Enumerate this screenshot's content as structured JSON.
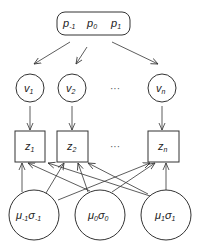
{
  "diagram": {
    "top_node": {
      "labels": [
        "p",
        "p",
        "p"
      ],
      "subs": [
        "-1",
        "0",
        "1"
      ]
    },
    "v_nodes": [
      {
        "base": "v",
        "sub": "1"
      },
      {
        "base": "v",
        "sub": "2"
      },
      {
        "base": "v",
        "sub": "n"
      }
    ],
    "z_nodes": [
      {
        "base": "z",
        "sub": "1"
      },
      {
        "base": "z",
        "sub": "2"
      },
      {
        "base": "z",
        "sub": "n"
      }
    ],
    "bottom_nodes": [
      {
        "mu": "μ",
        "mu_sub": "-1",
        "sigma": "σ",
        "sigma_sub": "-1"
      },
      {
        "mu": "μ",
        "mu_sub": "0",
        "sigma": "σ",
        "sigma_sub": "0"
      },
      {
        "mu": "μ",
        "mu_sub": "1",
        "sigma": "σ",
        "sigma_sub": "1"
      }
    ],
    "ellipsis": "···"
  }
}
